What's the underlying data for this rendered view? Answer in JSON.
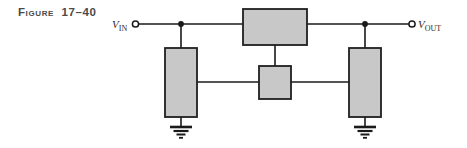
{
  "figure": {
    "caption": "Figure  17–40",
    "caption_icon": "figure-caption-text"
  },
  "colors": {
    "background": "#ffffff",
    "wire": "#1a1a1a",
    "component_fill": "#c8c8c8",
    "component_stroke": "#1f1f1f",
    "caption_text": "#4a4a4a",
    "label_text": "#2b2b2b",
    "ground": "#1a1a1a"
  },
  "schematic": {
    "title": "resistive-bridge-network",
    "input_terminal": {
      "label_main": "V",
      "label_sub": "IN",
      "icon": "open-circle-terminal",
      "x": 133,
      "y": 24
    },
    "output_terminal": {
      "label_main": "V",
      "label_sub": "OUT",
      "icon": "open-circle-terminal",
      "x": 415,
      "y": 24
    },
    "components": [
      {
        "name": "top-series-resistor",
        "shape": "rectangle",
        "orientation": "horizontal",
        "x": 243,
        "y": 9,
        "w": 64,
        "h": 36
      },
      {
        "name": "left-shunt-resistor",
        "shape": "rectangle",
        "orientation": "vertical",
        "x": 165,
        "y": 48,
        "w": 32,
        "h": 69
      },
      {
        "name": "center-bridge-resistor",
        "shape": "rectangle",
        "orientation": "vertical",
        "x": 259,
        "y": 66,
        "w": 32,
        "h": 33
      },
      {
        "name": "right-shunt-resistor",
        "shape": "rectangle",
        "orientation": "vertical",
        "x": 349,
        "y": 48,
        "w": 32,
        "h": 69
      }
    ],
    "junctions": [
      {
        "name": "input-node-junction",
        "x": 181,
        "y": 24
      },
      {
        "name": "output-node-junction",
        "x": 365,
        "y": 24
      }
    ],
    "grounds": [
      {
        "name": "left-ground-symbol",
        "x": 181,
        "y": 126
      },
      {
        "name": "right-ground-symbol",
        "x": 365,
        "y": 126
      }
    ],
    "wires": [
      {
        "name": "input-lead-wire",
        "x1": 139,
        "y1": 24,
        "x2": 243,
        "y2": 24
      },
      {
        "name": "output-lead-wire",
        "x1": 307,
        "y1": 24,
        "x2": 409,
        "y2": 24
      },
      {
        "name": "left-shunt-top-wire",
        "x1": 181,
        "y1": 24,
        "x2": 181,
        "y2": 48
      },
      {
        "name": "right-shunt-top-wire",
        "x1": 365,
        "y1": 24,
        "x2": 365,
        "y2": 48
      },
      {
        "name": "top-resistor-center-tap-wire",
        "x1": 275,
        "y1": 45,
        "x2": 275,
        "y2": 66
      },
      {
        "name": "left-to-center-wire",
        "x1": 197,
        "y1": 82,
        "x2": 259,
        "y2": 82
      },
      {
        "name": "center-to-right-wire",
        "x1": 291,
        "y1": 82,
        "x2": 349,
        "y2": 82
      },
      {
        "name": "left-ground-wire",
        "x1": 181,
        "y1": 117,
        "x2": 181,
        "y2": 126
      },
      {
        "name": "right-ground-wire",
        "x1": 365,
        "y1": 117,
        "x2": 365,
        "y2": 126
      }
    ]
  }
}
